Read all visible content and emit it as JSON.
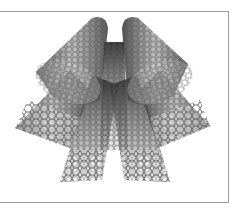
{
  "image": {
    "subject": "carbon nanotubes illustration",
    "tube_count": 5,
    "colors": {
      "background": "#ffffff",
      "frame": "#9a9a9a",
      "tube_dark": "#3a3a3a",
      "tube_mid": "#6e6e6e",
      "tube_light": "#bdbdbd",
      "mesh_stroke": "#555555"
    }
  }
}
